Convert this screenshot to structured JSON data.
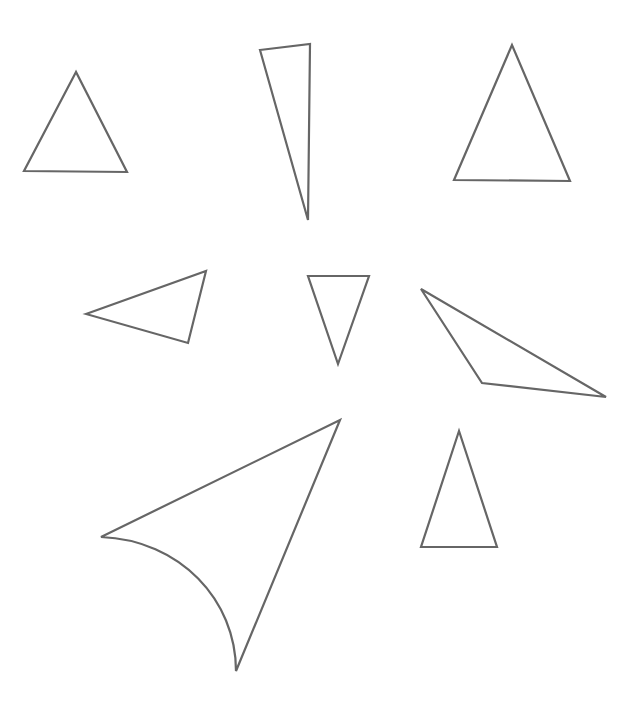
{
  "canvas": {
    "width": 637,
    "height": 706,
    "background": "#ffffff",
    "stroke_color": "#666666"
  },
  "shapes": [
    {
      "id": "triangle-1",
      "type": "polygon",
      "points": "76,72 24,171 127,172"
    },
    {
      "id": "triangle-2",
      "type": "polygon",
      "points": "260,50 310,44 308,220"
    },
    {
      "id": "triangle-3",
      "type": "polygon",
      "points": "512,45 454,180 570,181"
    },
    {
      "id": "triangle-4",
      "type": "polygon",
      "points": "86,314 206,271 188,343"
    },
    {
      "id": "triangle-5",
      "type": "polygon",
      "points": "308,276 369,276 338,364"
    },
    {
      "id": "triangle-6",
      "type": "polygon",
      "points": "421,289 606,397 482,383"
    },
    {
      "id": "curved-triangle",
      "type": "path",
      "d": "M 101,537 L 340,420 L 236,671 C 236,600 180,540 101,537 Z"
    },
    {
      "id": "triangle-7",
      "type": "polygon",
      "points": "459,431 421,547 497,547"
    }
  ]
}
